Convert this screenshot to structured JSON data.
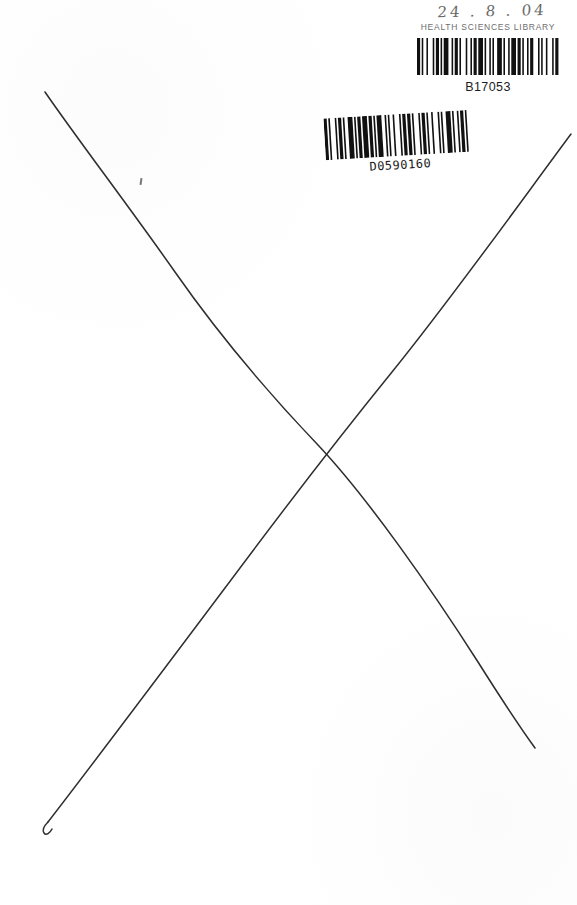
{
  "page": {
    "background_color": "#ffffff",
    "width": 577,
    "height": 905
  },
  "stamp": {
    "handwritten_date": "24 . 8 . 04",
    "library_name": "HEALTH SCIENCES LIBRARY"
  },
  "barcodes": [
    {
      "id": "barcode-primary",
      "number": "B17053",
      "symbology": "Code 39",
      "position": "top-right",
      "bar_pattern": "2,1,1,2,1,3,1,1,2,1,1,1,3,2,1,1,2,1,1,3,1,2,1,1,2,1,3,1,1,2,1,1,1,2,3,1,1,2,1,1,3,1,2,1,1,2,1,1,2,3,1,1,1,2,1,3,1,1,2,1"
    },
    {
      "id": "barcode-secondary",
      "number": "D0590160",
      "symbology": "Code 39",
      "position": "upper-centre",
      "rotation_degrees": -3.4,
      "bar_pattern": "2,1,1,3,1,1,2,1,1,2,3,1,1,1,2,1,3,1,2,1,1,1,3,2,1,1,1,2,1,3,1,1,2,1,2,1,1,3,1,1,2,1,1,2,1,3,1,1,1,2,3,1,1,2,1,1,2,1,1,3"
    }
  ],
  "marks": {
    "x_mark": {
      "name": "cancellation-x",
      "color": "#2e2e2e",
      "stroke_width": 1.5,
      "stroke_descending": {
        "from": [
          45,
          92
        ],
        "to": [
          535,
          748
        ],
        "note": "gently bowed stroke, top-left to bottom-right"
      },
      "stroke_ascending": {
        "from": [
          45,
          825
        ],
        "to": [
          572,
          133
        ],
        "note": "near-straight stroke with small hook at lower-left end"
      },
      "crossing_point": [
        305,
        425
      ]
    },
    "ink_speck": {
      "position": [
        141,
        182
      ]
    },
    "faint_smudge": {
      "position": [
        210,
        588
      ],
      "text": "illegible",
      "note": "very faint ghosted marking, not legible"
    }
  }
}
